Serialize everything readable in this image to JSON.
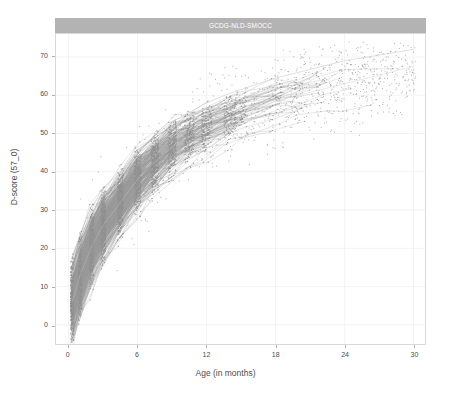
{
  "chart_data": {
    "type": "scatter",
    "title": "GCDG-NLD-SMOCC",
    "subtitle": "",
    "xlabel": "Age (in months)",
    "ylabel": "D-score (57_0)",
    "xlim": [
      -1.1,
      31.0
    ],
    "ylim": [
      -5.0,
      76.0
    ],
    "xticks": [
      0,
      6,
      12,
      18,
      24,
      30
    ],
    "xtick_labels": [
      "0",
      "6",
      "12",
      "18",
      "24",
      "30"
    ],
    "yticks": [
      0,
      10,
      20,
      30,
      40,
      50,
      60,
      70
    ],
    "ytick_labels": [
      "0",
      "10",
      "20",
      "30",
      "40",
      "50",
      "60",
      "70"
    ],
    "grid": true,
    "grid_color": "#f2f2f2",
    "legend": false,
    "legend_position": "none",
    "point_color": "#8c8c8c",
    "line_color": "#9a9a9a",
    "panel_background": "#ffffff",
    "panel_border_color": "#d9d9d9",
    "strip_background": "#b3b3b3",
    "strip_text_color": "#ffffff",
    "marker_size": 1.0,
    "visit_ages": [
      0.3,
      1.0,
      2.0,
      3.0,
      4.5,
      6.0,
      7.5,
      9.0,
      10.5,
      12.0,
      14.0,
      15.0,
      18.0,
      20.0,
      22.0,
      24.0,
      26.0,
      28.0,
      30.0
    ],
    "median_curve": {
      "x": [
        0.3,
        1.0,
        2.0,
        3.0,
        4.5,
        6.0,
        7.5,
        9.0,
        10.5,
        12.0,
        14.0,
        15.0,
        18.0,
        20.0,
        22.0,
        24.0,
        26.0,
        28.0,
        30.0
      ],
      "y": [
        6.0,
        13.0,
        20.5,
        26.0,
        32.0,
        38.0,
        42.5,
        46.5,
        49.0,
        51.5,
        54.0,
        55.5,
        58.5,
        60.0,
        61.5,
        63.0,
        64.5,
        66.0,
        67.5
      ]
    },
    "upper_curve": {
      "x": [
        0.3,
        1.0,
        2.0,
        3.0,
        4.5,
        6.0,
        7.5,
        9.0,
        10.5,
        12.0,
        14.0,
        15.0,
        18.0,
        20.0,
        22.0,
        24.0,
        26.0,
        28.0,
        30.0
      ],
      "y": [
        13.0,
        20.0,
        28.0,
        33.5,
        40.0,
        45.0,
        49.5,
        53.0,
        55.5,
        58.0,
        60.5,
        61.5,
        64.5,
        66.0,
        67.5,
        69.0,
        70.0,
        71.0,
        72.0
      ]
    },
    "lower_curve": {
      "x": [
        0.3,
        1.0,
        2.0,
        3.0,
        4.5,
        6.0,
        7.5,
        9.0,
        10.5,
        12.0,
        14.0,
        15.0,
        18.0,
        20.0,
        22.0,
        24.0,
        26.0,
        28.0,
        30.0
      ],
      "y": [
        -1.0,
        5.0,
        12.0,
        18.0,
        24.0,
        30.0,
        34.5,
        38.0,
        41.0,
        44.0,
        46.5,
        48.0,
        51.0,
        52.5,
        54.0,
        55.5,
        57.0,
        58.0,
        59.0
      ]
    },
    "series": [
      {
        "name": "D-score observations",
        "x_range": [
          0.0,
          30.5
        ],
        "y_range": [
          -4.0,
          73.0
        ],
        "n_points_approx": 12000
      }
    ]
  },
  "axes": {
    "y_title": "D-score (57_0)",
    "x_title": "Age (in months)",
    "x_tick_labels": [
      "0",
      "6",
      "12",
      "18",
      "24",
      "30"
    ],
    "y_tick_labels": [
      "0",
      "10",
      "20",
      "30",
      "40",
      "50",
      "60",
      "70"
    ]
  },
  "panel": {
    "strip_title": "GCDG-NLD-SMOCC"
  }
}
